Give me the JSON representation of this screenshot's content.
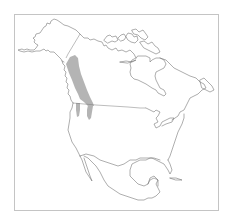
{
  "map": {
    "region": "North America",
    "type": "species range map",
    "frame": {
      "x": 14,
      "y": 14,
      "width": 205,
      "height": 197,
      "border_color": "#c4c4c4"
    },
    "colors": {
      "background": "#ffffff",
      "coastline": "#6a6a6a",
      "range_fill": "#b4b4b4"
    },
    "range": {
      "description": "Shaded distribution along the Rocky Mountains / interior British Columbia-Alberta, extending into northern Washington, Idaho and Montana",
      "areas": [
        "main-range-canada",
        "southern-lobe-west",
        "southern-lobe-east"
      ]
    }
  }
}
